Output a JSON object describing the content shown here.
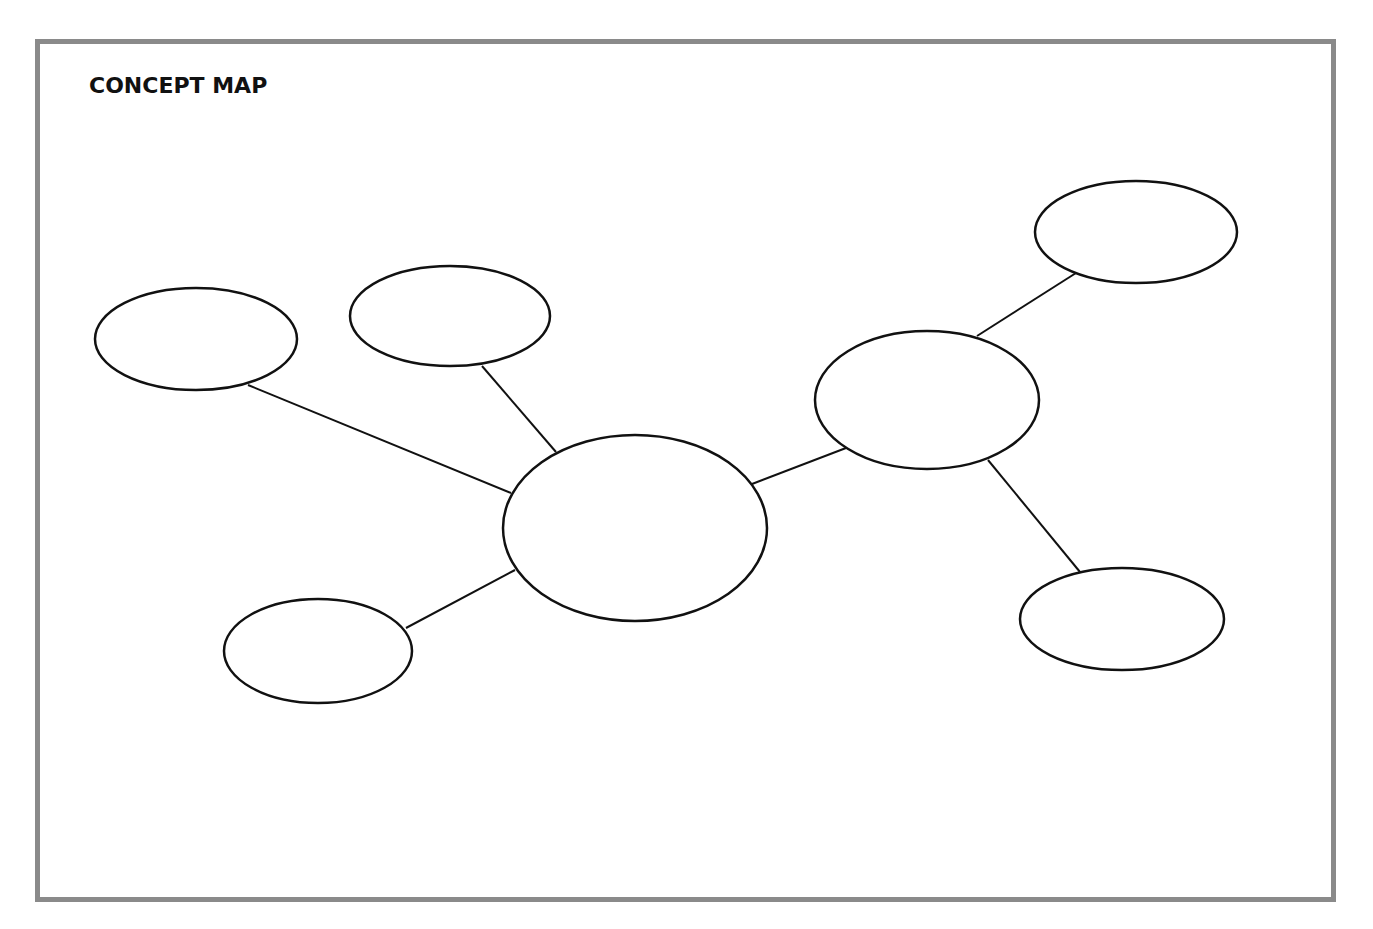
{
  "title": "CONCEPT MAP",
  "colors": {
    "frame_border": "#8a8a8a",
    "stroke": "#111111",
    "background": "#ffffff"
  },
  "nodes": [
    {
      "id": "center",
      "label": "",
      "cx": 635,
      "cy": 528,
      "rx": 132,
      "ry": 93
    },
    {
      "id": "left",
      "label": "",
      "cx": 196,
      "cy": 339,
      "rx": 101,
      "ry": 51
    },
    {
      "id": "top-middle",
      "label": "",
      "cx": 450,
      "cy": 316,
      "rx": 100,
      "ry": 50
    },
    {
      "id": "bottom-left",
      "label": "",
      "cx": 318,
      "cy": 651,
      "rx": 94,
      "ry": 52
    },
    {
      "id": "right-hub",
      "label": "",
      "cx": 927,
      "cy": 400,
      "rx": 112,
      "ry": 69
    },
    {
      "id": "top-right",
      "label": "",
      "cx": 1136,
      "cy": 232,
      "rx": 101,
      "ry": 51
    },
    {
      "id": "bottom-right",
      "label": "",
      "cx": 1122,
      "cy": 619,
      "rx": 102,
      "ry": 51
    }
  ],
  "edges": [
    {
      "from": "center",
      "to": "left",
      "x1": 511,
      "y1": 493,
      "x2": 248,
      "y2": 385
    },
    {
      "from": "center",
      "to": "top-middle",
      "x1": 556,
      "y1": 452,
      "x2": 482,
      "y2": 366
    },
    {
      "from": "center",
      "to": "bottom-left",
      "x1": 515,
      "y1": 570,
      "x2": 406,
      "y2": 628
    },
    {
      "from": "center",
      "to": "right-hub",
      "x1": 752,
      "y1": 484,
      "x2": 846,
      "y2": 448
    },
    {
      "from": "right-hub",
      "to": "top-right",
      "x1": 977,
      "y1": 336,
      "x2": 1076,
      "y2": 273
    },
    {
      "from": "right-hub",
      "to": "bottom-right",
      "x1": 988,
      "y1": 460,
      "x2": 1080,
      "y2": 572
    }
  ]
}
